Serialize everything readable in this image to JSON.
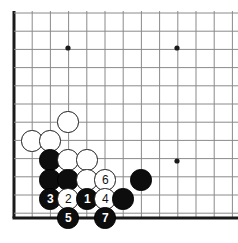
{
  "diagram": {
    "kind": "go-board-corner-diagram",
    "background_color": "#ffffff",
    "line_color": "#8a8a8a",
    "edge_color": "#1a1a1a",
    "black_color": "#0d0d0d",
    "white_color": "#ffffff",
    "board": {
      "origin_x": 14,
      "origin_y": 13,
      "spacing": 18.2,
      "cols": 13,
      "rows": 12,
      "bottom_edge_y": 218,
      "left_edge_x": 14,
      "left_edge_width": 3,
      "bottom_edge_width": 3,
      "grid_line_width": 1
    },
    "star_points": [
      {
        "name": "star-point-top-left",
        "x": 68,
        "y": 48
      },
      {
        "name": "star-point-top-right",
        "x": 177,
        "y": 48
      },
      {
        "name": "star-point-bottom-right",
        "x": 177,
        "y": 161
      }
    ],
    "stone_radius": 10.6,
    "stones": [
      {
        "name": "white-stone-a",
        "color": "white",
        "x": 68,
        "y": 122,
        "label": ""
      },
      {
        "name": "white-stone-b",
        "color": "white",
        "x": 32,
        "y": 141,
        "label": ""
      },
      {
        "name": "white-stone-c",
        "color": "white",
        "x": 50,
        "y": 141,
        "label": ""
      },
      {
        "name": "black-stone-d",
        "color": "black",
        "x": 50,
        "y": 160,
        "label": ""
      },
      {
        "name": "white-stone-e",
        "color": "white",
        "x": 68,
        "y": 160,
        "label": ""
      },
      {
        "name": "white-stone-f",
        "color": "white",
        "x": 87,
        "y": 160,
        "label": ""
      },
      {
        "name": "black-stone-g",
        "color": "black",
        "x": 50,
        "y": 180,
        "label": ""
      },
      {
        "name": "black-stone-h",
        "color": "black",
        "x": 68,
        "y": 180,
        "label": ""
      },
      {
        "name": "white-stone-i",
        "color": "white",
        "x": 87,
        "y": 180,
        "label": ""
      },
      {
        "name": "move-6-white",
        "color": "white",
        "x": 105,
        "y": 180,
        "label": "6"
      },
      {
        "name": "black-stone-j",
        "color": "black",
        "x": 141,
        "y": 180,
        "label": ""
      },
      {
        "name": "move-3-black",
        "color": "black",
        "x": 50,
        "y": 199,
        "label": "3"
      },
      {
        "name": "move-2-white",
        "color": "white",
        "x": 68,
        "y": 199,
        "label": "2"
      },
      {
        "name": "move-1-black",
        "color": "black",
        "x": 87,
        "y": 199,
        "label": "1"
      },
      {
        "name": "move-4-white",
        "color": "white",
        "x": 105,
        "y": 199,
        "label": "4"
      },
      {
        "name": "black-stone-k",
        "color": "black",
        "x": 123,
        "y": 199,
        "label": ""
      },
      {
        "name": "move-5-black",
        "color": "black",
        "x": 68,
        "y": 218,
        "label": "5"
      },
      {
        "name": "move-7-black",
        "color": "black",
        "x": 105,
        "y": 218,
        "label": "7"
      }
    ],
    "move_sequence": [
      {
        "number": "1",
        "color": "black"
      },
      {
        "number": "2",
        "color": "white"
      },
      {
        "number": "3",
        "color": "black"
      },
      {
        "number": "4",
        "color": "white"
      },
      {
        "number": "5",
        "color": "black"
      },
      {
        "number": "6",
        "color": "white"
      },
      {
        "number": "7",
        "color": "black"
      }
    ]
  }
}
